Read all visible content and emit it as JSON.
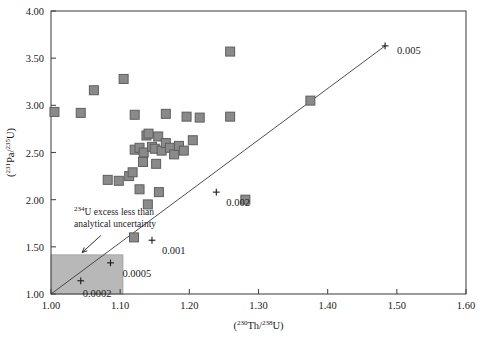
{
  "chart_data": {
    "type": "scatter",
    "title": "",
    "xlabel": "(230Th/238U)",
    "ylabel": "(231Pa/235U)",
    "xlabel_parts": {
      "open": "(",
      "sup1": "230",
      "el1": "Th/",
      "sup2": "238",
      "el2": "U)"
    },
    "ylabel_parts": {
      "open": "(",
      "sup1": "231",
      "el1": "Pa/",
      "sup2": "235",
      "el2": "U)"
    },
    "xlim": [
      1.0,
      1.6
    ],
    "ylim": [
      1.0,
      4.0
    ],
    "xticks": [
      "1.00",
      "1.10",
      "1.20",
      "1.30",
      "1.40",
      "1.50",
      "1.60"
    ],
    "xtick_values": [
      1.0,
      1.1,
      1.2,
      1.3,
      1.4,
      1.5,
      1.6
    ],
    "yticks": [
      "1.00",
      "1.50",
      "2.00",
      "2.50",
      "3.00",
      "3.50",
      "4.00"
    ],
    "ytick_values": [
      1.0,
      1.5,
      2.0,
      2.5,
      3.0,
      3.5,
      4.0
    ],
    "grid": false,
    "legend": null,
    "marker": {
      "shape": "square",
      "fill": "#8a8a8a",
      "edge": "#5e5e5e",
      "size_px": 9
    },
    "points": [
      {
        "x": 1.005,
        "y": 2.93
      },
      {
        "x": 1.043,
        "y": 2.92
      },
      {
        "x": 1.062,
        "y": 3.16
      },
      {
        "x": 1.105,
        "y": 3.28
      },
      {
        "x": 1.082,
        "y": 2.21
      },
      {
        "x": 1.098,
        "y": 2.2
      },
      {
        "x": 1.113,
        "y": 2.25
      },
      {
        "x": 1.118,
        "y": 2.29
      },
      {
        "x": 1.121,
        "y": 2.53
      },
      {
        "x": 1.128,
        "y": 2.55
      },
      {
        "x": 1.134,
        "y": 2.5
      },
      {
        "x": 1.138,
        "y": 2.68
      },
      {
        "x": 1.141,
        "y": 2.7
      },
      {
        "x": 1.146,
        "y": 2.56
      },
      {
        "x": 1.15,
        "y": 2.54
      },
      {
        "x": 1.155,
        "y": 2.67
      },
      {
        "x": 1.16,
        "y": 2.52
      },
      {
        "x": 1.166,
        "y": 2.6
      },
      {
        "x": 1.172,
        "y": 2.55
      },
      {
        "x": 1.178,
        "y": 2.48
      },
      {
        "x": 1.185,
        "y": 2.57
      },
      {
        "x": 1.192,
        "y": 2.52
      },
      {
        "x": 1.133,
        "y": 2.4
      },
      {
        "x": 1.152,
        "y": 2.38
      },
      {
        "x": 1.121,
        "y": 2.9
      },
      {
        "x": 1.166,
        "y": 2.91
      },
      {
        "x": 1.196,
        "y": 2.88
      },
      {
        "x": 1.215,
        "y": 2.87
      },
      {
        "x": 1.259,
        "y": 3.57
      },
      {
        "x": 1.205,
        "y": 2.63
      },
      {
        "x": 1.259,
        "y": 2.88
      },
      {
        "x": 1.375,
        "y": 3.05
      },
      {
        "x": 1.281,
        "y": 2.0
      },
      {
        "x": 1.14,
        "y": 1.95
      },
      {
        "x": 1.156,
        "y": 2.08
      },
      {
        "x": 1.12,
        "y": 1.6
      },
      {
        "x": 1.128,
        "y": 2.11
      }
    ],
    "isochron": {
      "name": "growth-curve",
      "from": [
        1.0,
        1.0
      ],
      "to": [
        1.483,
        3.63
      ],
      "tick_markers": [
        {
          "label": "0.0002",
          "x": 1.043,
          "y": 1.14
        },
        {
          "label": "0.0005",
          "x": 1.086,
          "y": 1.33
        },
        {
          "label": "0.001",
          "x": 1.146,
          "y": 1.57
        },
        {
          "label": "0.002",
          "x": 1.239,
          "y": 2.08
        },
        {
          "label": "0.005",
          "x": 1.483,
          "y": 3.63
        }
      ]
    },
    "shaded_region": {
      "name": "analytical-uncertainty-box",
      "x0": 1.0,
      "x1": 1.104,
      "y0": 1.0,
      "y1": 1.415,
      "fill": "#b8b8b8"
    },
    "annotation": {
      "line1_sup": "234",
      "line1_text": "U excess less than",
      "line2_text": "analytical uncertainty",
      "arrow_from": [
        1.072,
        1.62
      ],
      "arrow_to": [
        1.045,
        1.44
      ]
    }
  }
}
